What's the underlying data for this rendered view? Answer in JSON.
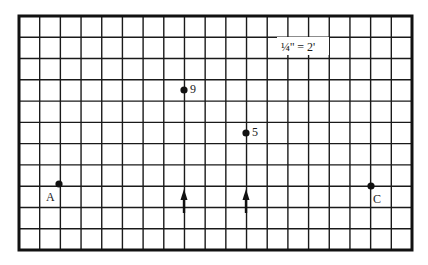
{
  "diagram": {
    "scale_label": "¼'' = 2'",
    "grid": {
      "columns": 19,
      "rows": 11,
      "frame": {
        "left": 19,
        "top": 16,
        "right": 412,
        "bottom": 250
      },
      "line_color": "#1a1a1a",
      "frame_color": "#111111"
    },
    "points": [
      {
        "id": "A",
        "label": "A",
        "x": 59,
        "y": 184,
        "label_x": 46,
        "label_y": 201
      },
      {
        "id": "9",
        "label": "9",
        "x": 184,
        "y": 90,
        "label_x": 190,
        "label_y": 93
      },
      {
        "id": "5",
        "label": "5",
        "x": 246,
        "y": 133,
        "label_x": 252,
        "label_y": 136
      },
      {
        "id": "C",
        "label": "C",
        "x": 371,
        "y": 186,
        "label_x": 373,
        "label_y": 203
      }
    ],
    "arrows": [
      {
        "id": "arrow-1",
        "x": 184,
        "tip_y": 189,
        "tail_y": 213,
        "direction": "up"
      },
      {
        "id": "arrow-2",
        "x": 246,
        "tip_y": 189,
        "tail_y": 213,
        "direction": "up"
      }
    ]
  }
}
